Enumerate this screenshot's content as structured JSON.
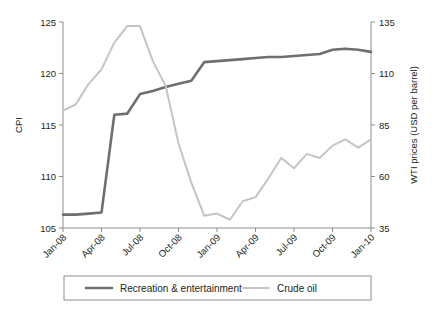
{
  "chart_data": {
    "type": "line",
    "title": "",
    "xlabel": "",
    "ylabel": "CPI",
    "y2label": "WTI prices (USD per barrel)",
    "grid": false,
    "legend_position": "bottom",
    "x": [
      "Jan-08",
      "Feb-08",
      "Mar-08",
      "Apr-08",
      "May-08",
      "Jun-08",
      "Jul-08",
      "Aug-08",
      "Sep-08",
      "Oct-08",
      "Nov-08",
      "Dec-08",
      "Jan-09",
      "Feb-09",
      "Mar-09",
      "Apr-09",
      "May-09",
      "Jun-09",
      "Jul-09",
      "Aug-09",
      "Sep-09",
      "Oct-09",
      "Nov-09",
      "Dec-09",
      "Jan-10"
    ],
    "xticklabels": [
      "Jan-08",
      "Apr-08",
      "Jul-08",
      "Oct-08",
      "Jan-09",
      "Apr-09",
      "Jul-09",
      "Oct-09",
      "Jan-10"
    ],
    "xtick_indices": [
      0,
      3,
      6,
      9,
      12,
      15,
      18,
      21,
      24
    ],
    "ylim": [
      105,
      125
    ],
    "yticks": [
      105,
      110,
      115,
      120,
      125
    ],
    "y2lim": [
      35,
      135
    ],
    "y2ticks": [
      35,
      60,
      85,
      110,
      135
    ],
    "series": [
      {
        "name": "Recreation & entertainment",
        "axis": "left",
        "color": "#6e6e6e",
        "width": 2.6,
        "values": [
          106.3,
          106.3,
          106.4,
          106.5,
          116.0,
          116.1,
          118.0,
          118.3,
          118.7,
          119.0,
          119.3,
          121.1,
          121.2,
          121.3,
          121.4,
          121.5,
          121.6,
          121.6,
          121.7,
          121.8,
          121.9,
          122.3,
          122.4,
          122.3,
          122.1
        ]
      },
      {
        "name": "Crude oil",
        "axis": "right",
        "color": "#c4c4c4",
        "width": 2.0,
        "values": [
          92.0,
          95.0,
          105.0,
          112.0,
          125.0,
          133.0,
          133.0,
          116.0,
          104.0,
          76.0,
          57.0,
          41.0,
          42.0,
          39.0,
          48.0,
          50.0,
          59.0,
          69.0,
          64.0,
          71.0,
          69.0,
          75.0,
          78.0,
          74.0,
          78.0
        ]
      }
    ]
  },
  "legend": {
    "items": [
      {
        "label": "Recreation & entertainment"
      },
      {
        "label": "Crude oil"
      }
    ]
  }
}
